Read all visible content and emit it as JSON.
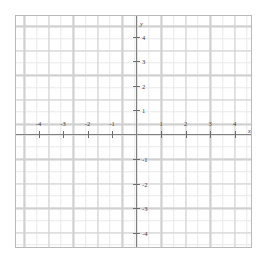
{
  "figure": {
    "kind": "cartesian-coordinate-plane",
    "background_color": "#ffffff",
    "border_color": "#b9b9b9"
  },
  "axes": {
    "x_axis_name": "x",
    "y_axis_name": "y",
    "axis_color": "#808080",
    "major_grid_color": "#d0d0d0",
    "minor_grid_color": "#e8e8e8",
    "tick_color": "#6e6e6e",
    "label_color": "#3a3a3a"
  },
  "chart_data": {
    "type": "scatter",
    "title": "",
    "xlabel": "x",
    "ylabel": "y",
    "xlim": [
      -4.9,
      4.8
    ],
    "ylim": [
      -4.65,
      4.8
    ],
    "grid": true,
    "minor_grid": true,
    "minor_grid_step": 0.5,
    "major_grid_step": 1,
    "legend": null,
    "series": [],
    "x": [],
    "y": [],
    "xticks": [
      -4,
      -3,
      -2,
      -1,
      1,
      2,
      3,
      4
    ],
    "yticks": [
      4,
      3,
      2,
      1,
      -1,
      -2,
      -3,
      -4
    ],
    "xticklabels": [
      "-4",
      "-3",
      "-2",
      "-1",
      "1",
      "2",
      "3",
      "4"
    ],
    "yticklabels": [
      "4",
      "3",
      "2",
      "1",
      "-1",
      "-2",
      "-3",
      "-4"
    ],
    "annotations": []
  },
  "x_ticks": [
    {
      "label": "-4",
      "value": -4
    },
    {
      "label": "-3",
      "value": -3
    },
    {
      "label": "-2",
      "value": -2
    },
    {
      "label": "-1",
      "value": -1
    },
    {
      "label": "1",
      "value": 1
    },
    {
      "label": "2",
      "value": 2
    },
    {
      "label": "3",
      "value": 3
    },
    {
      "label": "4",
      "value": 4
    }
  ],
  "y_ticks": [
    {
      "label": "4",
      "value": 4
    },
    {
      "label": "3",
      "value": 3
    },
    {
      "label": "2",
      "value": 2
    },
    {
      "label": "1",
      "value": 1
    },
    {
      "label": "-1",
      "value": -1
    },
    {
      "label": "-2",
      "value": -2
    },
    {
      "label": "-3",
      "value": -3
    },
    {
      "label": "-4",
      "value": -4
    }
  ]
}
